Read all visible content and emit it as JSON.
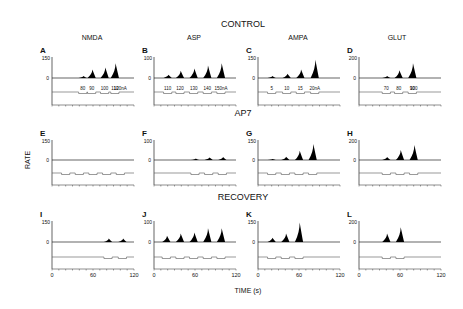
{
  "figure": {
    "row_titles": [
      "CONTROL",
      "AP7",
      "RECOVERY"
    ],
    "column_titles": [
      "NMDA",
      "ASP",
      "AMPA",
      "GLUT"
    ],
    "ylabel": "RATE",
    "xlabel": "TIME (s)",
    "x_ticks": [
      "0",
      "60",
      "120"
    ]
  },
  "chart_data": [
    {
      "panel": "A",
      "row": "CONTROL",
      "agonist": "NMDA",
      "type": "area",
      "ylim": [
        0,
        150
      ],
      "yticks": [
        "150",
        "0"
      ],
      "xlim": [
        0,
        120
      ],
      "current_labels": [
        "80",
        "90",
        "100",
        "110",
        "120nA"
      ],
      "peaks": [
        {
          "x": 45,
          "y": 15
        },
        {
          "x": 58,
          "y": 60
        },
        {
          "x": 77,
          "y": 75
        },
        {
          "x": 92,
          "y": 105
        }
      ]
    },
    {
      "panel": "B",
      "row": "CONTROL",
      "agonist": "ASP",
      "type": "area",
      "ylim": [
        0,
        100
      ],
      "yticks": [
        "100",
        "0"
      ],
      "xlim": [
        0,
        120
      ],
      "current_labels": [
        "110",
        "120",
        "130",
        "140",
        "150nA"
      ],
      "peaks": [
        {
          "x": 20,
          "y": 15
        },
        {
          "x": 38,
          "y": 35
        },
        {
          "x": 58,
          "y": 45
        },
        {
          "x": 78,
          "y": 60
        },
        {
          "x": 98,
          "y": 70
        }
      ]
    },
    {
      "panel": "C",
      "row": "CONTROL",
      "agonist": "AMPA",
      "type": "area",
      "ylim": [
        0,
        150
      ],
      "yticks": [
        "150",
        "0"
      ],
      "xlim": [
        0,
        120
      ],
      "current_labels": [
        "5",
        "10",
        "15",
        "20nA"
      ],
      "peaks": [
        {
          "x": 20,
          "y": 15
        },
        {
          "x": 42,
          "y": 30
        },
        {
          "x": 62,
          "y": 60
        },
        {
          "x": 83,
          "y": 130
        }
      ]
    },
    {
      "panel": "D",
      "row": "CONTROL",
      "agonist": "GLUT",
      "type": "area",
      "ylim": [
        0,
        200
      ],
      "yticks": [
        "200",
        "0"
      ],
      "xlim": [
        0,
        120
      ],
      "current_labels": [
        "70",
        "80",
        "90",
        "100"
      ],
      "peaks": [
        {
          "x": 40,
          "y": 20
        },
        {
          "x": 58,
          "y": 75
        },
        {
          "x": 78,
          "y": 140
        }
      ]
    },
    {
      "panel": "E",
      "row": "AP7",
      "agonist": "NMDA",
      "type": "area",
      "ylim": [
        0,
        150
      ],
      "yticks": [
        "150",
        "0"
      ],
      "xlim": [
        0,
        120
      ],
      "peaks": []
    },
    {
      "panel": "F",
      "row": "AP7",
      "agonist": "ASP",
      "type": "area",
      "ylim": [
        0,
        100
      ],
      "yticks": [
        "100",
        "0"
      ],
      "xlim": [
        0,
        120
      ],
      "peaks": [
        {
          "x": 60,
          "y": 8
        },
        {
          "x": 80,
          "y": 12
        },
        {
          "x": 100,
          "y": 15
        }
      ]
    },
    {
      "panel": "G",
      "row": "AP7",
      "agonist": "AMPA",
      "type": "area",
      "ylim": [
        0,
        150
      ],
      "yticks": [
        "150",
        "0"
      ],
      "xlim": [
        0,
        120
      ],
      "peaks": [
        {
          "x": 20,
          "y": 8
        },
        {
          "x": 40,
          "y": 25
        },
        {
          "x": 60,
          "y": 70
        },
        {
          "x": 80,
          "y": 120
        }
      ]
    },
    {
      "panel": "H",
      "row": "AP7",
      "agonist": "GLUT",
      "type": "area",
      "ylim": [
        0,
        200
      ],
      "yticks": [
        "200",
        "0"
      ],
      "xlim": [
        0,
        120
      ],
      "peaks": [
        {
          "x": 40,
          "y": 30
        },
        {
          "x": 60,
          "y": 100
        },
        {
          "x": 80,
          "y": 150
        }
      ]
    },
    {
      "panel": "I",
      "row": "RECOVERY",
      "agonist": "NMDA",
      "type": "area",
      "ylim": [
        0,
        150
      ],
      "yticks": [
        "150",
        "0"
      ],
      "xlim": [
        0,
        120
      ],
      "peaks": [
        {
          "x": 82,
          "y": 25
        },
        {
          "x": 103,
          "y": 25
        }
      ]
    },
    {
      "panel": "J",
      "row": "RECOVERY",
      "agonist": "ASP",
      "type": "area",
      "ylim": [
        0,
        100
      ],
      "yticks": [
        "100",
        "0"
      ],
      "xlim": [
        0,
        120
      ],
      "peaks": [
        {
          "x": 18,
          "y": 30
        },
        {
          "x": 38,
          "y": 40
        },
        {
          "x": 58,
          "y": 45
        },
        {
          "x": 78,
          "y": 65
        },
        {
          "x": 98,
          "y": 65
        }
      ]
    },
    {
      "panel": "K",
      "row": "RECOVERY",
      "agonist": "AMPA",
      "type": "area",
      "ylim": [
        0,
        150
      ],
      "yticks": [
        "150",
        "0"
      ],
      "xlim": [
        0,
        120
      ],
      "peaks": [
        {
          "x": 20,
          "y": 30
        },
        {
          "x": 40,
          "y": 60
        },
        {
          "x": 60,
          "y": 140
        }
      ]
    },
    {
      "panel": "L",
      "row": "RECOVERY",
      "agonist": "GLUT",
      "type": "area",
      "ylim": [
        0,
        200
      ],
      "yticks": [
        "200",
        "0"
      ],
      "xlim": [
        0,
        120
      ],
      "peaks": [
        {
          "x": 40,
          "y": 80
        },
        {
          "x": 60,
          "y": 140
        }
      ]
    }
  ]
}
